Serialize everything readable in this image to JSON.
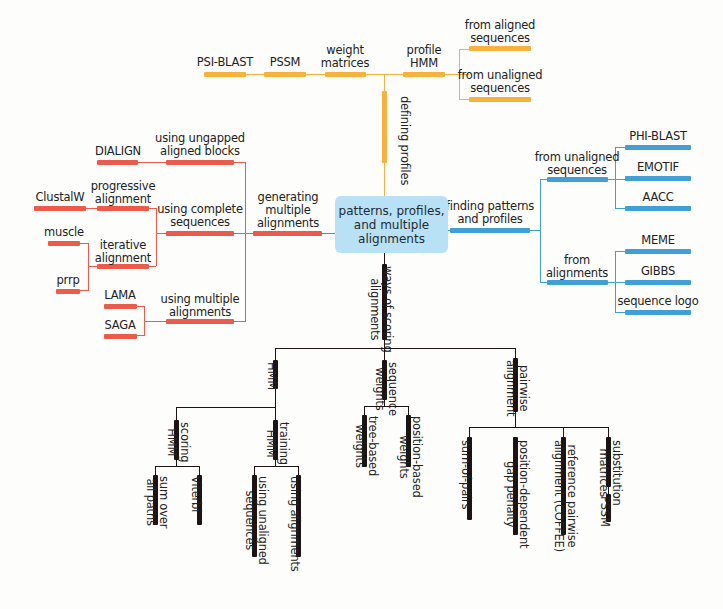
{
  "center": {
    "label": "patterns, profiles,\nand multiple\nalignments"
  },
  "colors": {
    "profiles": "#f6b23d",
    "multiple_alignments": "#ec5a4b",
    "patterns": "#3f9fd6",
    "scoring": "#1c1414",
    "center_box": "#b8e1f5"
  },
  "profiles_branch": {
    "label": "defining profiles",
    "items": [
      {
        "label": "PSI-BLAST"
      },
      {
        "label": "PSSM"
      },
      {
        "label": "weight\nmatrices"
      },
      {
        "label": "profile\nHMM"
      },
      {
        "label": "from aligned\nsequences"
      },
      {
        "label": "from unaligned\nsequences"
      }
    ]
  },
  "alignments_branch": {
    "label": "generating\nmultiple\nalignments",
    "groups": [
      {
        "label": "using ungapped\naligned blocks",
        "children": [
          {
            "label": "DIALIGN"
          }
        ]
      },
      {
        "label": "using complete\nsequences",
        "children": [
          {
            "label": "progressive\nalignment",
            "children": [
              {
                "label": "ClustalW"
              }
            ]
          },
          {
            "label": "iterative\nalignment",
            "children": [
              {
                "label": "muscle"
              },
              {
                "label": "prrp"
              }
            ]
          }
        ]
      },
      {
        "label": "using multiple\nalignments",
        "children": [
          {
            "label": "LAMA"
          },
          {
            "label": "SAGA"
          }
        ]
      }
    ]
  },
  "patterns_branch": {
    "label": "finding patterns\nand profiles",
    "groups": [
      {
        "label": "from unaligned\nsequences",
        "children": [
          {
            "label": "PHI-BLAST"
          },
          {
            "label": "EMOTIF"
          },
          {
            "label": "AACC"
          }
        ]
      },
      {
        "label": "from\nalignments",
        "children": [
          {
            "label": "MEME"
          },
          {
            "label": "GIBBS"
          },
          {
            "label": "sequence logo"
          }
        ]
      }
    ]
  },
  "scoring_branch": {
    "label": "ways of scoring\nalignments",
    "groups": [
      {
        "label": "HMM",
        "children": [
          {
            "label": "scoring\nHMM",
            "children": [
              {
                "label": "sum over\nall paths"
              },
              {
                "label": "Viterbi"
              }
            ]
          },
          {
            "label": "training\nHMM",
            "children": [
              {
                "label": "using unaligned\nsequences"
              },
              {
                "label": "using alignments"
              }
            ]
          }
        ]
      },
      {
        "label": "sequence\nweights",
        "children": [
          {
            "label": "tree-based\nweights"
          },
          {
            "label": "position-based\nweights"
          }
        ]
      },
      {
        "label": "pairwise\nalignment",
        "children": [
          {
            "label": "sum-of-pairs"
          },
          {
            "label": "position-dependent\ngap penalty"
          },
          {
            "label": "reference pairwise\nalignment (COFFEE)"
          },
          {
            "label": "substitution\nmatrices",
            "children": [
              {
                "label": "PSSM"
              }
            ]
          }
        ]
      }
    ]
  }
}
